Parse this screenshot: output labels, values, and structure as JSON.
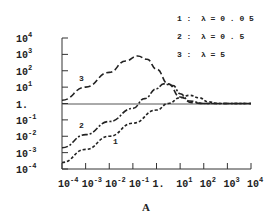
{
  "chart_data": {
    "type": "line",
    "title": "",
    "caption": "A",
    "xlabel": "",
    "ylabel": "",
    "xscale": "log",
    "yscale": "log",
    "xlim": [
      0.0001,
      10000
    ],
    "ylim": [
      0.0001,
      10000
    ],
    "x_tick_labels": [
      "10^-4",
      "10^-3",
      "10^-2",
      "10^-1",
      "1.",
      "10^1",
      "10^2",
      "10^3",
      "10^4"
    ],
    "y_tick_labels": [
      "10^4",
      "10^3",
      "10^2",
      "10^1",
      "1.",
      "10^-1",
      "10^-2",
      "10^-3",
      "10^-4"
    ],
    "reference_line": {
      "y": 1,
      "style": "solid"
    },
    "legend": [
      {
        "id": "1",
        "text": "1 :  λ = 0 . 0 5"
      },
      {
        "id": "2",
        "text": "2 :  λ = 0 . 5"
      },
      {
        "id": "3",
        "text": "3 :  λ = 5"
      }
    ],
    "legend_position": "upper right",
    "grid": false,
    "series": [
      {
        "name": "1: λ=0.05",
        "style": "short-dash",
        "log10_x": [
          -4,
          -3,
          -2,
          -1,
          0,
          0.5,
          1.0,
          1.4,
          1.8,
          2.2,
          2.6,
          3,
          4
        ],
        "log10_y": [
          -3.6,
          -2.8,
          -2.0,
          -1.2,
          -0.4,
          0.0,
          0.35,
          0.5,
          0.35,
          0.1,
          0.0,
          0.0,
          0.0
        ]
      },
      {
        "name": "2: λ=0.5",
        "style": "dash-dot",
        "log10_x": [
          -4,
          -3,
          -2,
          -1,
          -0.5,
          0,
          0.3,
          0.7,
          1.0,
          1.4,
          2,
          3,
          4
        ],
        "log10_y": [
          -2.7,
          -1.9,
          -1.1,
          -0.3,
          0.3,
          0.9,
          1.2,
          1.1,
          0.6,
          0.15,
          0.0,
          0.0,
          0.0
        ]
      },
      {
        "name": "3: λ=5",
        "style": "long-dash",
        "log10_x": [
          -4,
          -3,
          -2,
          -1.3,
          -0.8,
          -0.4,
          0,
          0.5,
          1.0,
          1.5,
          2,
          3,
          4
        ],
        "log10_y": [
          0.2,
          1.0,
          1.9,
          2.6,
          2.9,
          2.7,
          2.1,
          1.2,
          0.4,
          0.05,
          0.0,
          0.0,
          0.0
        ]
      }
    ]
  },
  "labels": {
    "curve1": "1",
    "curve2": "2",
    "curve3": "3",
    "caption": "A",
    "legend1": "1 :  λ = 0 . 0 5",
    "legend2": "2 :  λ = 0 . 5",
    "legend3": "3 :  λ = 5"
  },
  "y_ticks": [
    {
      "base": "10",
      "exp": "4"
    },
    {
      "base": "10",
      "exp": "3"
    },
    {
      "base": "10",
      "exp": "2"
    },
    {
      "base": "10",
      "exp": "1"
    },
    {
      "base": "1.",
      "exp": ""
    },
    {
      "base": "10",
      "exp": "-1"
    },
    {
      "base": "10",
      "exp": "-2"
    },
    {
      "base": "10",
      "exp": "-3"
    },
    {
      "base": "10",
      "exp": "-4"
    }
  ],
  "x_ticks": [
    {
      "base": "10",
      "exp": "-4"
    },
    {
      "base": "10",
      "exp": "-3"
    },
    {
      "base": "10",
      "exp": "-2"
    },
    {
      "base": "10",
      "exp": "-1"
    },
    {
      "base": "1.",
      "exp": ""
    },
    {
      "base": "10",
      "exp": "1"
    },
    {
      "base": "10",
      "exp": "2"
    },
    {
      "base": "10",
      "exp": "3"
    },
    {
      "base": "10",
      "exp": "4"
    }
  ]
}
